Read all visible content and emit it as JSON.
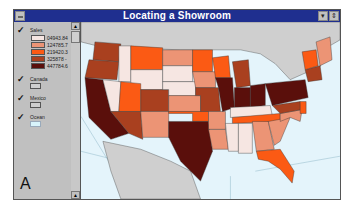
{
  "window": {
    "title": "Locating a Showroom"
  },
  "legend": {
    "sales": {
      "label": "Sales",
      "checked": true,
      "classes": [
        {
          "label": "04943.84",
          "color": "#f6e6e2"
        },
        {
          "label": "124785.7",
          "color": "#ec9475"
        },
        {
          "label": "219420.3",
          "color": "#fb5a14"
        },
        {
          "label": "325878 -",
          "color": "#a9401f"
        },
        {
          "label": "447784.6",
          "color": "#5a0f0b"
        }
      ]
    },
    "canada": {
      "label": "Canada",
      "checked": true,
      "color": "#cfcfcf"
    },
    "mexico": {
      "label": "Mexico",
      "checked": true,
      "color": "#cfcfcf"
    },
    "ocean": {
      "label": "Ocean",
      "checked": true,
      "color": "#d8f4fb"
    },
    "panel_letter": "A"
  },
  "map": {
    "ocean_color": "#e4f4fb",
    "land_color": "#cfcfcf",
    "region": "Continental United States by state sales"
  }
}
